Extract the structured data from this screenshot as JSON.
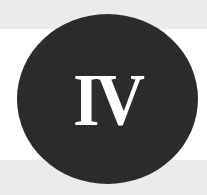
{
  "badge": {
    "numeral": "IV",
    "colors": {
      "circle": "#2b2b2b",
      "numeral": "#ffffff",
      "bands": "#ebebeb",
      "background": "#ffffff"
    }
  }
}
